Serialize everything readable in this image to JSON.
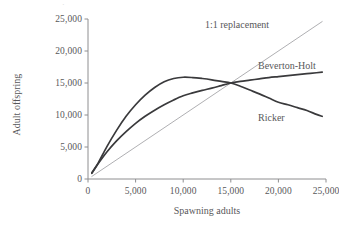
{
  "chart_data": {
    "type": "line",
    "title": "",
    "xlabel": "Spawning adults",
    "ylabel": "Adult offspring",
    "xlim": [
      0,
      25000
    ],
    "ylim": [
      0,
      25000
    ],
    "xticks": [
      0,
      5000,
      10000,
      15000,
      20000,
      25000
    ],
    "yticks": [
      0,
      5000,
      10000,
      15000,
      20000,
      25000
    ],
    "xticklabels": [
      "0",
      "5,000",
      "10,000",
      "15,000",
      "20,000",
      "25,000"
    ],
    "yticklabels": [
      "0",
      "5,000",
      "10,000",
      "15,000",
      "20,000",
      "25,000"
    ],
    "grid": false,
    "legend_position": "inline-annotations",
    "intersection_point": [
      15000,
      15000
    ],
    "series": [
      {
        "name": "1:1 replacement",
        "style": "thin-straight-line",
        "color": "#9b9b9e",
        "width": 0.8,
        "x": [
          400,
          24600
        ],
        "values": [
          400,
          24600
        ]
      },
      {
        "name": "Beverton-Holt",
        "style": "saturating-curve",
        "color": "#3a3a3c",
        "width": 1.7,
        "x": [
          400,
          1000,
          2000,
          3000,
          4000,
          5000,
          6000,
          7000,
          8000,
          9000,
          10000,
          11000,
          12000,
          13000,
          14000,
          15000,
          16000,
          17000,
          18000,
          19000,
          20000,
          21000,
          22000,
          23000,
          24000,
          24600
        ],
        "values": [
          950,
          2250,
          4250,
          5950,
          7400,
          8700,
          9800,
          10750,
          11600,
          12350,
          13000,
          13450,
          13850,
          14200,
          14600,
          15000,
          15250,
          15450,
          15650,
          15850,
          16000,
          16150,
          16300,
          16450,
          16600,
          16700
        ]
      },
      {
        "name": "Ricker",
        "style": "dome-curve",
        "color": "#3a3a3c",
        "width": 1.7,
        "peak_x": 10000,
        "peak_y": 15900,
        "x": [
          400,
          1000,
          2000,
          3000,
          4000,
          5000,
          6000,
          7000,
          8000,
          9000,
          10000,
          11000,
          12000,
          13000,
          14000,
          15000,
          16000,
          17000,
          18000,
          19000,
          20000,
          21000,
          22000,
          23000,
          24000,
          24600
        ],
        "values": [
          900,
          2300,
          5100,
          7600,
          9800,
          11600,
          13100,
          14300,
          15200,
          15700,
          15900,
          15850,
          15700,
          15500,
          15250,
          15000,
          14500,
          13900,
          13300,
          12650,
          12000,
          11600,
          11150,
          10700,
          10100,
          9800
        ]
      }
    ],
    "annotations": [
      {
        "text": "1:1 replacement",
        "for": "1:1 replacement"
      },
      {
        "text": "Beverton-Holt",
        "for": "Beverton-Holt"
      },
      {
        "text": "Ricker",
        "for": "Ricker"
      }
    ]
  },
  "colors": {
    "background": "#ffffff",
    "axis": "#8e8e90",
    "text": "#58585a",
    "curve_dark": "#3a3a3c",
    "line_light": "#9b9b9e"
  }
}
